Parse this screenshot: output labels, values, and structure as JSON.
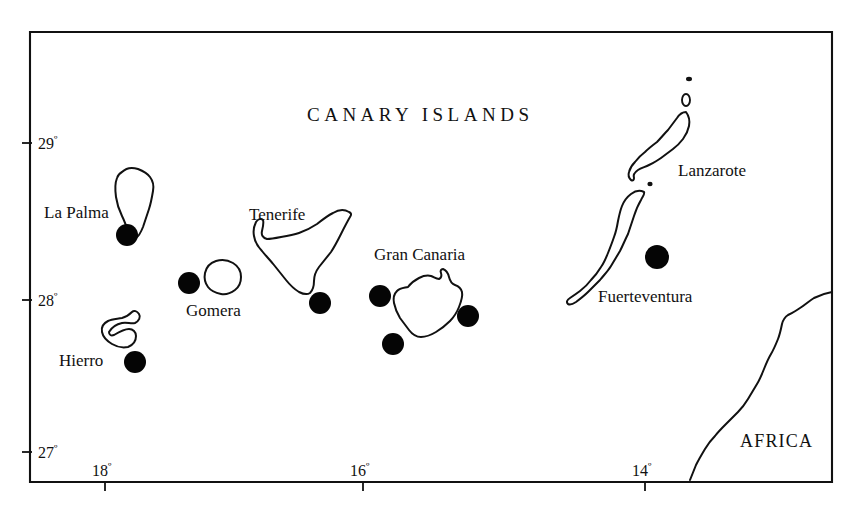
{
  "map": {
    "title": "CANARY ISLANDS",
    "continent_label": "AFRICA",
    "frame": {
      "left": 30,
      "top": 32,
      "right": 832,
      "bottom": 482
    },
    "background_color": "#ffffff",
    "ink_color": "#111111",
    "projection": {
      "lon_left_deg": 18.82,
      "lon_right_deg": 13.1,
      "lat_top_deg": 29.6,
      "lat_bottom_deg": 26.75
    },
    "latitude_axis": {
      "name": "latitude",
      "ticks": [
        {
          "label": "29",
          "symbol": "º",
          "y": 143
        },
        {
          "label": "28",
          "symbol": "º",
          "y": 300
        },
        {
          "label": "27",
          "symbol": "º",
          "y": 452
        }
      ]
    },
    "longitude_axis": {
      "name": "longitude",
      "ticks": [
        {
          "label": "18",
          "symbol": "º",
          "x": 105
        },
        {
          "label": "16",
          "symbol": "º",
          "x": 363
        },
        {
          "label": "14",
          "symbol": "º",
          "x": 645
        }
      ]
    },
    "islands": [
      {
        "name": "La Palma",
        "label": "La Palma",
        "label_x": 44,
        "label_y": 204
      },
      {
        "name": "Tenerife",
        "label": "Tenerife",
        "label_x": 249,
        "label_y": 206
      },
      {
        "name": "Gomera",
        "label": "Gomera",
        "label_x": 186,
        "label_y": 302
      },
      {
        "name": "Hierro",
        "label": "Hierro",
        "label_x": 59,
        "label_y": 352
      },
      {
        "name": "Gran Canaria",
        "label": "Gran Canaria",
        "label_x": 374,
        "label_y": 246
      },
      {
        "name": "Lanzarote",
        "label": "Lanzarote",
        "label_x": 678,
        "label_y": 162
      },
      {
        "name": "Fuerteventura",
        "label": "Fuerteventura",
        "label_x": 598,
        "label_y": 288
      }
    ],
    "sample_sites": [
      {
        "near": "La Palma",
        "x": 127,
        "y": 235,
        "r": 11
      },
      {
        "near": "Gomera",
        "x": 189,
        "y": 283,
        "r": 11
      },
      {
        "near": "Hierro",
        "x": 135,
        "y": 362,
        "r": 11
      },
      {
        "near": "Tenerife",
        "x": 320,
        "y": 303,
        "r": 11
      },
      {
        "near": "Gran Canaria",
        "x": 380,
        "y": 296,
        "r": 11
      },
      {
        "near": "Gran Canaria",
        "x": 393,
        "y": 344,
        "r": 11
      },
      {
        "near": "Gran Canaria",
        "x": 468,
        "y": 316,
        "r": 11
      },
      {
        "near": "Fuerteventura",
        "x": 657,
        "y": 257,
        "r": 12
      }
    ],
    "islets": [
      {
        "name": "Alegranza",
        "x": 689,
        "y": 79,
        "rx": 3.0,
        "ry": 2.2
      },
      {
        "name": "La Graciosa",
        "x": 686,
        "y": 100,
        "rx": 4.0,
        "ry": 6.0
      },
      {
        "name": "Isla de Lobos",
        "x": 650,
        "y": 184,
        "rx": 2.6,
        "ry": 2.2
      }
    ]
  }
}
